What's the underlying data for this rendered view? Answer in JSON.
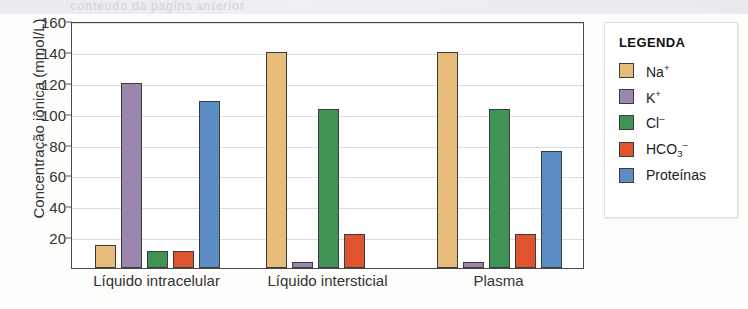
{
  "bleed_text": "conteudo da pagina anterior",
  "chart_data": {
    "type": "bar",
    "title": "",
    "xlabel": "",
    "ylabel": "Concentração iônica (mmol/L)",
    "ylim": [
      0,
      160
    ],
    "ytick_values": [
      20,
      40,
      60,
      80,
      100,
      120,
      140,
      160
    ],
    "ytick_labels": [
      "20",
      "40",
      "60",
      "80",
      "100",
      "120",
      "140",
      "160"
    ],
    "grid": true,
    "legend_position": "right",
    "legend_title": "LEGENDA",
    "categories": [
      "Líquido intracelular",
      "Líquido intersticial",
      "Plasma"
    ],
    "series": [
      {
        "name": "Na+",
        "label_html": "Na<sup>+</sup>",
        "color": "#e8bd79",
        "values": [
          15,
          140,
          140
        ]
      },
      {
        "name": "K+",
        "label_html": "K<sup>+</sup>",
        "color": "#9b87ae",
        "values": [
          120,
          4,
          4
        ]
      },
      {
        "name": "Cl-",
        "label_html": "Cl<sup>–</sup>",
        "color": "#3f9355",
        "values": [
          11,
          103,
          103
        ]
      },
      {
        "name": "HCO3-",
        "label_html": "HCO<sub>3</sub><sup>–</sup>",
        "color": "#e0532f",
        "values": [
          11,
          22,
          22
        ]
      },
      {
        "name": "Proteinas",
        "label_html": "Proteínas",
        "color": "#5b8cc4",
        "values": [
          108,
          0,
          76
        ]
      }
    ]
  }
}
